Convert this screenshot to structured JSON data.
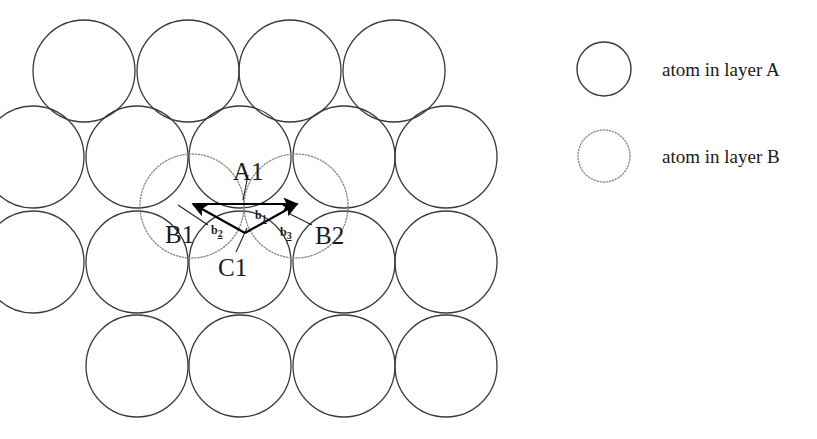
{
  "figure": {
    "type": "crystal-lattice-diagram",
    "background_color": "#ffffff",
    "stroke_color_layer_a": "#3a3a3a",
    "stroke_color_layer_b": "#8c8c8c",
    "vector_color": "#000000"
  },
  "lattice": {
    "atom_radius": 51,
    "layer_a_rows": [
      {
        "y": 71,
        "cx": [
          84,
          188,
          290,
          394
        ]
      },
      {
        "y": 157,
        "cx": [
          33,
          137,
          240,
          344,
          446
        ]
      },
      {
        "y": 262,
        "cx": [
          33,
          137,
          240,
          344,
          446
        ]
      },
      {
        "y": 366,
        "cx": [
          137,
          240,
          344,
          446
        ]
      }
    ],
    "layer_b_atoms": [
      {
        "cx": 192,
        "cy": 206,
        "r": 52,
        "label": "B1"
      },
      {
        "cx": 296,
        "cy": 206,
        "r": 52,
        "label": "B2"
      }
    ]
  },
  "site_labels": [
    {
      "id": "A1",
      "text": "A1",
      "x": 233,
      "y": 159
    },
    {
      "id": "B1",
      "text": "B1",
      "x": 165,
      "y": 222
    },
    {
      "id": "B2",
      "text": "B2",
      "x": 315,
      "y": 223
    },
    {
      "id": "C1",
      "text": "C1",
      "x": 218,
      "y": 255
    }
  ],
  "vectors": [
    {
      "id": "b1",
      "label": "b",
      "subscript": "1",
      "x1": 193,
      "y1": 204,
      "x2": 297,
      "y2": 204,
      "label_x": 255,
      "label_y": 209
    },
    {
      "id": "b2",
      "label": "b",
      "subscript": "2",
      "x1": 245,
      "y1": 233,
      "x2": 193,
      "y2": 204,
      "label_x": 211,
      "label_y": 224
    },
    {
      "id": "b3",
      "label": "b",
      "subscript": "3",
      "x1": 245,
      "y1": 233,
      "x2": 297,
      "y2": 204,
      "label_x": 280,
      "label_y": 226
    }
  ],
  "leader_lines": [
    {
      "for": "A1",
      "x1": 248,
      "y1": 175,
      "x2": 243,
      "y2": 200
    },
    {
      "for": "B1",
      "x1": 208,
      "y1": 225,
      "x2": 178,
      "y2": 205
    },
    {
      "for": "B2",
      "x1": 312,
      "y1": 225,
      "x2": 288,
      "y2": 213
    },
    {
      "for": "C1",
      "x1": 236,
      "y1": 252,
      "x2": 247,
      "y2": 228
    }
  ],
  "legend": {
    "items": [
      {
        "id": "layer-a",
        "text": "atom in layer A",
        "circle": {
          "cx": 604,
          "cy": 69,
          "r": 27,
          "style": "solid"
        },
        "text_x": 662,
        "text_y": 60
      },
      {
        "id": "layer-b",
        "text": "atom in layer B",
        "circle": {
          "cx": 604,
          "cy": 156,
          "r": 26,
          "style": "dotted"
        },
        "text_x": 662,
        "text_y": 147
      }
    ]
  }
}
